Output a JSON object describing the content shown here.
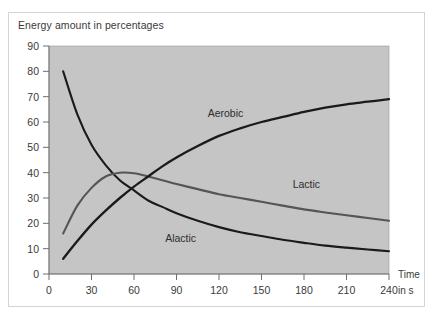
{
  "figure": {
    "title": "Energy amount in percentages",
    "plot_background": "#c5c5c5",
    "page_background": "#ffffff",
    "border_color": "#d4d4d4"
  },
  "axes": {
    "x_title_line1": "Time",
    "x_title_line2": "in s",
    "x_ticks": [
      "0",
      "30",
      "60",
      "90",
      "120",
      "150",
      "180",
      "210",
      "240"
    ],
    "y_ticks": [
      "0",
      "10",
      "20",
      "30",
      "40",
      "50",
      "60",
      "70",
      "80",
      "90"
    ]
  },
  "series_labels": {
    "aerobic": "Aerobic",
    "lactic": "Lactic",
    "alactic": "Alactic"
  },
  "chart_data": {
    "type": "line",
    "title": "Energy amount in percentages",
    "xlabel": "Time in s",
    "ylabel": "Energy amount in percentages",
    "xlim": [
      0,
      240
    ],
    "ylim": [
      0,
      90
    ],
    "x_ticks": [
      0,
      30,
      60,
      90,
      120,
      150,
      180,
      210,
      240
    ],
    "y_ticks": [
      0,
      10,
      20,
      30,
      40,
      50,
      60,
      70,
      80,
      90
    ],
    "grid": false,
    "legend": "inline-annotations",
    "series": [
      {
        "name": "Alactic",
        "color": "#1a1a1a",
        "x": [
          10,
          20,
          30,
          40,
          50,
          60,
          70,
          80,
          90,
          105,
          120,
          135,
          150,
          165,
          180,
          195,
          210,
          225,
          240
        ],
        "values": [
          80,
          63,
          51,
          43,
          37,
          33,
          29,
          26.5,
          24,
          21,
          18.5,
          16.5,
          15,
          13.5,
          12.3,
          11.2,
          10.4,
          9.7,
          9
        ]
      },
      {
        "name": "Lactic",
        "color": "#555555",
        "x": [
          10,
          20,
          30,
          40,
          50,
          60,
          70,
          80,
          90,
          105,
          120,
          135,
          150,
          165,
          180,
          195,
          210,
          225,
          240
        ],
        "values": [
          16,
          27,
          34,
          38.5,
          40,
          39.8,
          38.5,
          37,
          35.5,
          33.5,
          31.5,
          30,
          28.5,
          27,
          25.5,
          24.3,
          23.2,
          22.1,
          21
        ]
      },
      {
        "name": "Aerobic",
        "color": "#1a1a1a",
        "x": [
          10,
          20,
          30,
          40,
          50,
          60,
          70,
          80,
          90,
          105,
          120,
          135,
          150,
          165,
          180,
          195,
          210,
          225,
          240
        ],
        "values": [
          6,
          13,
          19.5,
          25,
          30,
          34.5,
          38.5,
          42.5,
          46,
          50.5,
          54.5,
          57.5,
          60,
          62,
          64,
          65.7,
          67,
          68,
          69
        ]
      }
    ],
    "annotations": [
      {
        "text": "Aerobic",
        "x": 112,
        "y": 62
      },
      {
        "text": "Lactic",
        "x": 172,
        "y": 34
      },
      {
        "text": "Alactic",
        "x": 82,
        "y": 12.5
      }
    ]
  }
}
